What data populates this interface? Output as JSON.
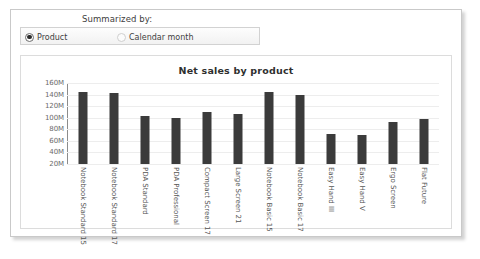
{
  "window": {
    "summarize": {
      "caption": "Summarized by:",
      "options": [
        {
          "label": "Product",
          "selected": true
        },
        {
          "label": "Calendar month",
          "selected": false
        }
      ]
    }
  },
  "chart_data": {
    "type": "bar",
    "title": "Net sales by product",
    "xlabel": "",
    "ylabel": "",
    "ylim": [
      20,
      160
    ],
    "grid": true,
    "legend": null,
    "ytick_labels": [
      "160M",
      "140M",
      "120M",
      "100M",
      "80M",
      "60M",
      "40M",
      "20M"
    ],
    "ytick_values": [
      160,
      140,
      120,
      100,
      80,
      60,
      40,
      20
    ],
    "categories": [
      "Notebook Standard 15",
      "Notebook Standard 17",
      "PDA Standard",
      "PDA Professional",
      "Compact Screen 17",
      "Large Screen 21",
      "Notebook Basic 15",
      "Notebook Basic 17",
      "Easy Hand III",
      "Easy Hand V",
      "Ergo Screen",
      "Flat Future"
    ],
    "values": [
      145,
      143,
      103,
      99,
      110,
      107,
      145,
      140,
      72,
      70,
      93,
      97
    ],
    "unit": "M",
    "bar_color": "#3b3b3b"
  }
}
